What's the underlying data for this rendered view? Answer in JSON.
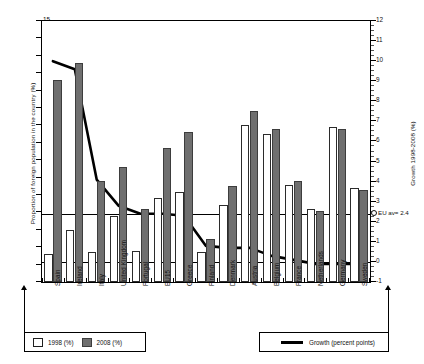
{
  "chart_data": {
    "type": "bar",
    "title": "",
    "categories": [
      "Spain",
      "Ireland",
      "Italy",
      "United Kingdom",
      "Portugal",
      "EU15",
      "Greece",
      "Finland",
      "Denmark",
      "Austria",
      "Belgium",
      "France",
      "Netherlands",
      "Germany",
      "Sweden"
    ],
    "series": [
      {
        "name": "1998 (%)",
        "values": [
          1.6,
          3.0,
          1.7,
          3.8,
          1.8,
          4.8,
          5.2,
          1.7,
          4.4,
          9.0,
          8.5,
          5.6,
          4.2,
          8.9,
          5.4
        ],
        "color": "#ffffff"
      },
      {
        "name": "2008 (%)",
        "values": [
          11.6,
          12.6,
          5.8,
          6.6,
          4.2,
          7.7,
          8.6,
          2.5,
          5.5,
          9.8,
          8.8,
          5.8,
          4.1,
          8.8,
          5.3
        ],
        "color": "#6f6f6f"
      }
    ],
    "growth_line": {
      "name": "Growth (percent points)",
      "unit": "percent points",
      "values": [
        10.0,
        9.6,
        4.1,
        2.8,
        2.4,
        2.4,
        2.3,
        0.8,
        0.7,
        0.7,
        0.3,
        0.1,
        -0.1,
        -0.1,
        -0.1
      ],
      "color": "#000000"
    },
    "ylabel": "Proportion of foreign population in the country (%)",
    "ylim": [
      0,
      15
    ],
    "yticks": [
      0,
      1,
      2,
      3,
      4,
      5,
      6,
      7,
      8,
      9,
      10,
      11,
      12,
      13,
      14,
      15
    ],
    "y2label": "Growth 1998-2008 (%)",
    "y2lim": [
      -1,
      12
    ],
    "y2ticks": [
      -1,
      0,
      1,
      2,
      3,
      4,
      5,
      6,
      7,
      8,
      9,
      10,
      11,
      12
    ],
    "xlabel": "",
    "grid": false,
    "reference_lines": [
      {
        "label": "EU av= 2.4",
        "y2_value": 2.4
      },
      {
        "label": "",
        "y2_value": 0
      }
    ],
    "annotations": [
      {
        "text": "EU av= 2.4",
        "y2_value": 2.4
      }
    ],
    "legend_position": "bottom"
  },
  "axes": {
    "y_left_title": "Proportion of foreign population in the country (%)",
    "y_right_title": "Growth 1998-2008 (%)",
    "y_left_ticks": [
      "0",
      "1",
      "2",
      "3",
      "4",
      "5",
      "6",
      "7",
      "8",
      "9",
      "10",
      "11",
      "12",
      "13",
      "14",
      "15"
    ],
    "y_right_ticks": [
      "-1",
      "0",
      "1",
      "2",
      "3",
      "4",
      "5",
      "6",
      "7",
      "8",
      "9",
      "10",
      "11",
      "12"
    ]
  },
  "categories": [
    "Spain",
    "Ireland",
    "Italy",
    "United Kingdom",
    "Portugal",
    "EU15",
    "Greece",
    "Finland",
    "Denmark",
    "Austria",
    "Belgium",
    "France",
    "Netherlands",
    "Germany",
    "Sweden"
  ],
  "annotation": {
    "eu_average": "EU av= 2.4"
  },
  "legend": {
    "bars": [
      {
        "label": "1998 (%)",
        "swatch": "white"
      },
      {
        "label": "2008 (%)",
        "swatch": "dark"
      }
    ],
    "line": {
      "label": "Growth (percent points)"
    }
  }
}
